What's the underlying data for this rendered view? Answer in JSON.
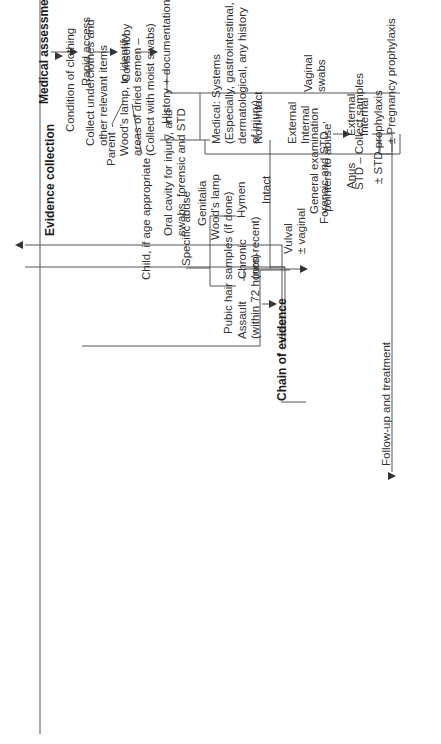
{
  "diagram": {
    "medical_assessment": "Medical assessment",
    "rapid_access": "Rapid access",
    "consent_by": "Consent by",
    "parent": "Parent",
    "child": "Child, if age appropriate",
    "history": "History + documentation",
    "medical_systems": "Medical: Systems\n(Especially, gastrointestinal,\ndermatological, any history\nof injury)",
    "specific_abuse": "Specific abuse",
    "chronic": "Chronic\n(non-recent)",
    "assault": "Assault\n(within 72 hours)",
    "chain_of_evidence": "Chain of evidence",
    "general_exam": "General examination\n'pointers to abuse'",
    "std_collect": "STD – Collect samples",
    "follow_up": "Follow-up and treatment",
    "evidence_collection": "Evidence collection",
    "condition_clothing": "Condition of clothing",
    "collect_underclothes": "Collect underclothes and\nother relevant items",
    "woods_lamp_semen": "Wood's lamp, to identify\nareas of dried semen –\n(Collect with moist swabs)",
    "oral_cavity": "Oral cavity for injury, and\nswabs, forensic and STD",
    "genitalia": "Genitalia",
    "woods_lamp": "Wood's lamp",
    "pubic_hair": "Pubic hair samples (if done)",
    "hymen": "Hymen",
    "intact": "Intact",
    "vulval": "Vulval\n± vaginal",
    "non_intact": "Non-intact",
    "external_internal": "External\nInternal",
    "vaginal_swabs": "Vaginal\nswabs",
    "forensic_std": "Forensic and STD",
    "anus": "Anus",
    "anus_ext_int": "External\nInternal",
    "std_prophylaxis": "± STD prophylaxis",
    "pregnancy_prophylaxis": "± Pregnancy prophylaxis"
  }
}
